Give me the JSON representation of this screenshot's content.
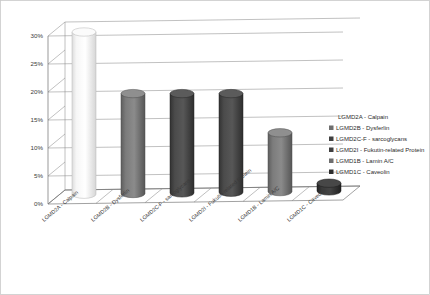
{
  "chart_data": {
    "type": "bar",
    "title": "",
    "subtitle": "",
    "xlabel": "",
    "ylabel": "",
    "categories": [
      "LGMD2A - Calpain",
      "LGMD2B - Dysferlin",
      "LGMD2C-F - sarcoglycans",
      "LGMD2I - Fukutin-related Protein",
      "LGMD1B - Lamin A/C",
      "LGMD1C - Caveolin"
    ],
    "values": [
      30,
      19,
      19,
      19,
      12,
      3
    ],
    "ylim": [
      0,
      30
    ],
    "yticks": [
      0,
      5,
      10,
      15,
      20,
      25,
      30
    ],
    "ytick_labels": [
      "0%",
      "5%",
      "10%",
      "15%",
      "20%",
      "25%",
      "30%"
    ],
    "grid": true,
    "legend_position": "right-inside",
    "legend": [
      {
        "label": "LGMD2A - Calpain",
        "color": "#f2f2f2",
        "swatch_visible": false
      },
      {
        "label": "LGMD2B - Dysferlin",
        "color": "#6e6e6e",
        "swatch_visible": true
      },
      {
        "label": "LGMD2C-F - sarcoglycans",
        "color": "#3f3f3f",
        "swatch_visible": true
      },
      {
        "label": "LGMD2I - Fukutin-related Protein",
        "color": "#3f3f3f",
        "swatch_visible": true
      },
      {
        "label": "LGMD1B - Lamin A/C",
        "color": "#6e6e6e",
        "swatch_visible": true
      },
      {
        "label": "LGMD1C - Caveolin",
        "color": "#2d2d2d",
        "swatch_visible": true
      }
    ],
    "series_colors": [
      "#f2f2f2",
      "#6e6e6e",
      "#3f3f3f",
      "#3f3f3f",
      "#6e6e6e",
      "#2d2d2d"
    ],
    "style": "3d-cylinder"
  }
}
